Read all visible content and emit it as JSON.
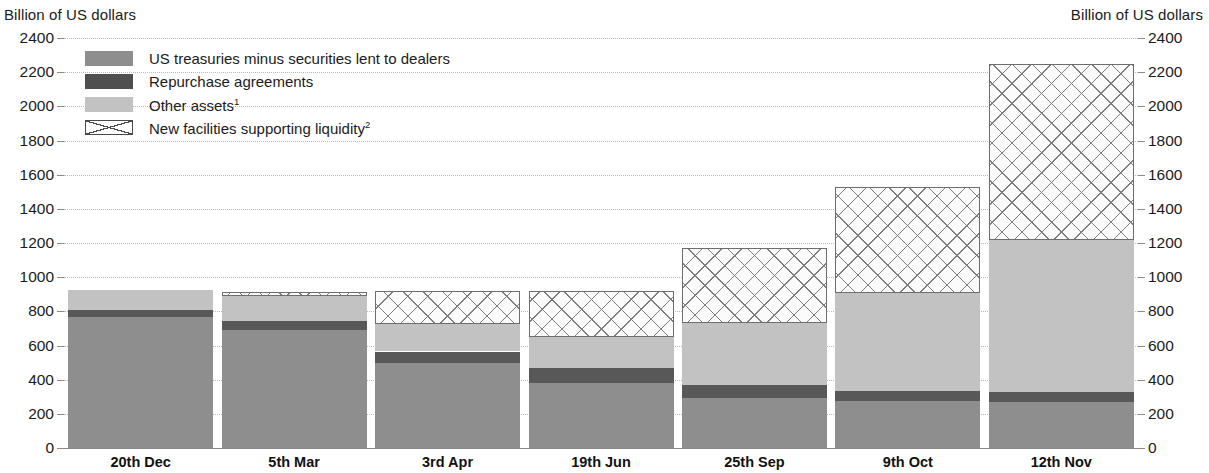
{
  "axis_caption_left": "Billion of US dollars",
  "axis_caption_right": "Billion of US dollars",
  "legend": [
    {
      "key": "treasuries",
      "label": "US treasuries minus securities lent to dealers",
      "sup": "",
      "color": "#8e8e8e"
    },
    {
      "key": "repo",
      "label": "Repurchase agreements",
      "sup": "",
      "color": "#4f4f4f"
    },
    {
      "key": "other",
      "label": "Other assets",
      "sup": "1",
      "color": "#c2c2c2"
    },
    {
      "key": "newfac",
      "label": "New facilities supporting liquidity",
      "sup": "2",
      "color": "#ffffff"
    }
  ],
  "chart_data": {
    "type": "bar",
    "title": "",
    "subtitle": "",
    "xlabel": "",
    "ylabel": "Billion of US dollars",
    "ylabel_right": "Billion of US dollars",
    "ylim": [
      0,
      2400
    ],
    "yticks": [
      0,
      200,
      400,
      600,
      800,
      1000,
      1200,
      1400,
      1600,
      1800,
      2000,
      2200,
      2400
    ],
    "ytick_labels": [
      "0",
      "200",
      "400",
      "600",
      "800",
      "1000",
      "1200",
      "1400",
      "1600",
      "1800",
      "2000",
      "2200",
      "2400"
    ],
    "grid": true,
    "stacked": true,
    "legend_position": "inside-top-left",
    "categories": [
      "20th Dec",
      "5th Mar",
      "3rd Apr",
      "19th Jun",
      "25th Sep",
      "9th Oct",
      "12th Nov"
    ],
    "series": [
      {
        "name": "US treasuries minus securities lent to dealers",
        "key": "treasuries",
        "color": "#8e8e8e",
        "values": [
          765,
          690,
          500,
          380,
          290,
          275,
          270
        ]
      },
      {
        "name": "Repurchase agreements",
        "key": "repo",
        "color": "#585858",
        "values": [
          45,
          55,
          65,
          90,
          80,
          60,
          60
        ]
      },
      {
        "name": "Other assets",
        "key": "other",
        "color": "#c2c2c2",
        "values": [
          115,
          145,
          160,
          180,
          360,
          575,
          890
        ]
      },
      {
        "name": "New facilities supporting liquidity",
        "key": "newfac",
        "color": "#ffffff",
        "values": [
          0,
          25,
          195,
          270,
          440,
          620,
          1030
        ]
      }
    ],
    "totals": [
      925,
      915,
      920,
      920,
      1170,
      1530,
      2250
    ]
  }
}
